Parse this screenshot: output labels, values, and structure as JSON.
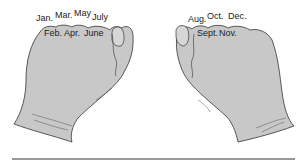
{
  "diagram": {
    "left_fist": {
      "top_knuckles": [
        {
          "label": "Jan.",
          "x": 37,
          "y": 14
        },
        {
          "label": "Mar.",
          "x": 55,
          "y": 11
        },
        {
          "label": "May",
          "x": 74,
          "y": 9
        },
        {
          "label": "July",
          "x": 92,
          "y": 13
        }
      ],
      "valleys": [
        {
          "label": "Feb.",
          "x": 44,
          "y": 29
        },
        {
          "label": "Apr.",
          "x": 64,
          "y": 29
        },
        {
          "label": "June",
          "x": 84,
          "y": 29
        }
      ]
    },
    "right_fist": {
      "top_knuckles": [
        {
          "label": "Aug.",
          "x": 188,
          "y": 15
        },
        {
          "label": "Oct.",
          "x": 207,
          "y": 12
        },
        {
          "label": "Dec.",
          "x": 228,
          "y": 12
        }
      ],
      "valleys": [
        {
          "label": "Sept.",
          "x": 197,
          "y": 29
        },
        {
          "label": "Nov.",
          "x": 219,
          "y": 29
        }
      ]
    },
    "colors": {
      "hand_fill": "#c8c8c8",
      "outline": "#333333",
      "text": "#222222",
      "rule": "#333333"
    }
  }
}
